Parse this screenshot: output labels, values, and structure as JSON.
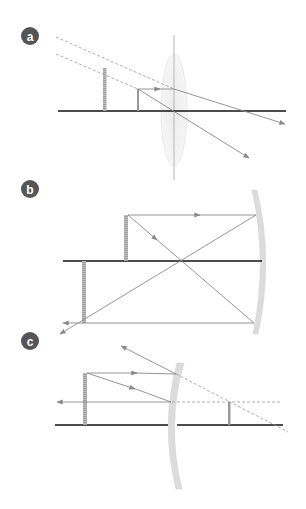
{
  "figure": {
    "panels": [
      {
        "label": "a",
        "description": "Converging lens used as a magnifier: object inside focal length forms enlarged virtual upright image (dashed extrapolated rays).",
        "optic": "converging-lens"
      },
      {
        "label": "b",
        "description": "Concave mirror: object beyond center of curvature forms real, inverted, reduced image in front of mirror.",
        "optic": "concave-mirror"
      },
      {
        "label": "c",
        "description": "Convex mirror: object forms virtual, upright, reduced image behind mirror (dashed extrapolated rays).",
        "optic": "convex-mirror"
      }
    ]
  },
  "colors": {
    "badge": "#555555",
    "axis": "#111111",
    "ray": "#8a8a8a",
    "optic": "#dcdcdc",
    "object": "#9a9a9a"
  }
}
